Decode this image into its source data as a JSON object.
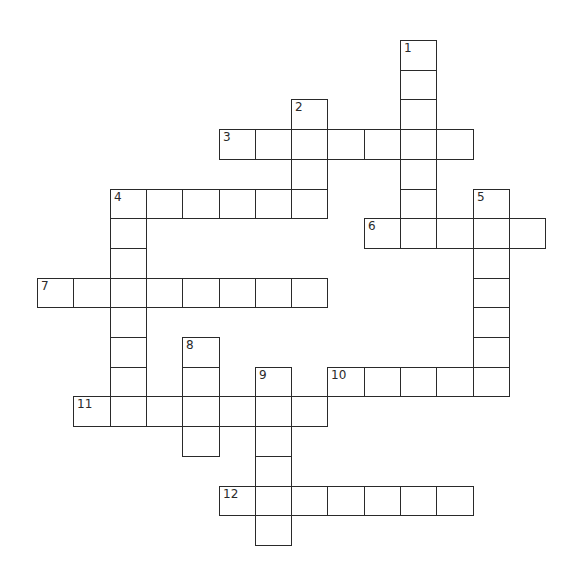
{
  "puzzle": {
    "layout": {
      "origin_x": 37,
      "origin_y": 40,
      "cell_w": 36.3,
      "cell_h": 29.7,
      "line_color": "#2a2a2a"
    },
    "words": [
      {
        "number": 1,
        "direction": "down",
        "col": 10,
        "row": 0,
        "length": 7
      },
      {
        "number": 2,
        "direction": "down",
        "col": 7,
        "row": 2,
        "length": 4
      },
      {
        "number": 3,
        "direction": "across",
        "col": 5,
        "row": 3,
        "length": 7
      },
      {
        "number": 4,
        "direction": "across",
        "col": 2,
        "row": 5,
        "length": 6
      },
      {
        "number": 4,
        "direction": "down",
        "col": 2,
        "row": 5,
        "length": 8
      },
      {
        "number": 5,
        "direction": "down",
        "col": 12,
        "row": 5,
        "length": 7
      },
      {
        "number": 6,
        "direction": "across",
        "col": 9,
        "row": 6,
        "length": 5
      },
      {
        "number": 7,
        "direction": "across",
        "col": 0,
        "row": 8,
        "length": 8
      },
      {
        "number": 8,
        "direction": "down",
        "col": 4,
        "row": 10,
        "length": 4
      },
      {
        "number": 9,
        "direction": "down",
        "col": 6,
        "row": 11,
        "length": 6
      },
      {
        "number": 10,
        "direction": "across",
        "col": 8,
        "row": 11,
        "length": 5
      },
      {
        "number": 11,
        "direction": "across",
        "col": 1,
        "row": 12,
        "length": 7
      },
      {
        "number": 12,
        "direction": "across",
        "col": 5,
        "row": 15,
        "length": 7
      }
    ]
  }
}
